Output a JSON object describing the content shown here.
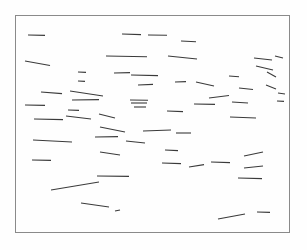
{
  "figure": {
    "name": "line-segment-orientation-field",
    "background_color": "#fefefe",
    "ink_color": "#3a3a3a",
    "frame_color": "#8a8a8a",
    "frame_stroke_width": 1,
    "canvas": {
      "width": 307,
      "height": 250
    }
  },
  "frame": {
    "x": 15.5,
    "y": 15.5,
    "width": 274,
    "height": 217
  },
  "chart_data": {
    "type": "scatter",
    "title": "",
    "subtitle": "",
    "xlabel": "",
    "ylabel": "",
    "grid": false,
    "legend": null,
    "axis_ticks": [],
    "xlim": [
      15,
      290
    ],
    "ylim": [
      15,
      233
    ],
    "series": [
      {
        "name": "segments",
        "element": "line",
        "count": 66,
        "stroke": "#3a3a3a",
        "stroke_width": 1.1,
        "values": [
          {
            "x1": 28,
            "y1": 35,
            "x2": 45,
            "y2": 35.4
          },
          {
            "x1": 122,
            "y1": 34,
            "x2": 141,
            "y2": 34.6
          },
          {
            "x1": 148,
            "y1": 35,
            "x2": 167,
            "y2": 35.2
          },
          {
            "x1": 181,
            "y1": 41,
            "x2": 196,
            "y2": 41.8
          },
          {
            "x1": 106,
            "y1": 56,
            "x2": 147,
            "y2": 56.8
          },
          {
            "x1": 168,
            "y1": 56,
            "x2": 197,
            "y2": 59
          },
          {
            "x1": 25,
            "y1": 61,
            "x2": 50,
            "y2": 65.5
          },
          {
            "x1": 254,
            "y1": 58,
            "x2": 272,
            "y2": 60
          },
          {
            "x1": 275,
            "y1": 56,
            "x2": 283,
            "y2": 58
          },
          {
            "x1": 78,
            "y1": 72,
            "x2": 86,
            "y2": 72.4
          },
          {
            "x1": 114,
            "y1": 73,
            "x2": 130,
            "y2": 72.6
          },
          {
            "x1": 131,
            "y1": 75,
            "x2": 158,
            "y2": 75.6
          },
          {
            "x1": 256,
            "y1": 66,
            "x2": 273,
            "y2": 70
          },
          {
            "x1": 78,
            "y1": 81,
            "x2": 85,
            "y2": 81.4
          },
          {
            "x1": 138,
            "y1": 85,
            "x2": 153,
            "y2": 84.4
          },
          {
            "x1": 175,
            "y1": 82,
            "x2": 186,
            "y2": 81.6
          },
          {
            "x1": 196,
            "y1": 82,
            "x2": 214,
            "y2": 86
          },
          {
            "x1": 267,
            "y1": 72,
            "x2": 276,
            "y2": 77
          },
          {
            "x1": 229,
            "y1": 76,
            "x2": 239,
            "y2": 76.8
          },
          {
            "x1": 41,
            "y1": 92,
            "x2": 62,
            "y2": 93.6
          },
          {
            "x1": 70,
            "y1": 91,
            "x2": 103,
            "y2": 96
          },
          {
            "x1": 239,
            "y1": 88,
            "x2": 253,
            "y2": 89.5
          },
          {
            "x1": 266,
            "y1": 85,
            "x2": 276,
            "y2": 89
          },
          {
            "x1": 278,
            "y1": 93,
            "x2": 285,
            "y2": 94
          },
          {
            "x1": 72,
            "y1": 100,
            "x2": 99,
            "y2": 99.6
          },
          {
            "x1": 209,
            "y1": 98,
            "x2": 229,
            "y2": 95.5
          },
          {
            "x1": 25,
            "y1": 105,
            "x2": 45,
            "y2": 105.4
          },
          {
            "x1": 130,
            "y1": 100,
            "x2": 148,
            "y2": 100.2
          },
          {
            "x1": 131,
            "y1": 103,
            "x2": 147,
            "y2": 103
          },
          {
            "x1": 134,
            "y1": 107,
            "x2": 146,
            "y2": 107
          },
          {
            "x1": 68,
            "y1": 110,
            "x2": 79,
            "y2": 110.4
          },
          {
            "x1": 194,
            "y1": 104,
            "x2": 215,
            "y2": 104.4
          },
          {
            "x1": 232,
            "y1": 102,
            "x2": 248,
            "y2": 103
          },
          {
            "x1": 277,
            "y1": 101,
            "x2": 284,
            "y2": 101.4
          },
          {
            "x1": 34,
            "y1": 119,
            "x2": 63,
            "y2": 119.6
          },
          {
            "x1": 66,
            "y1": 116,
            "x2": 91,
            "y2": 119
          },
          {
            "x1": 99,
            "y1": 114,
            "x2": 115,
            "y2": 118
          },
          {
            "x1": 167,
            "y1": 111,
            "x2": 183,
            "y2": 111.6
          },
          {
            "x1": 230,
            "y1": 117,
            "x2": 256,
            "y2": 118
          },
          {
            "x1": 100,
            "y1": 127,
            "x2": 125,
            "y2": 132
          },
          {
            "x1": 143,
            "y1": 131,
            "x2": 171,
            "y2": 130
          },
          {
            "x1": 176,
            "y1": 133,
            "x2": 191,
            "y2": 133
          },
          {
            "x1": 33,
            "y1": 140,
            "x2": 72,
            "y2": 142
          },
          {
            "x1": 95,
            "y1": 137,
            "x2": 118,
            "y2": 136.6
          },
          {
            "x1": 126,
            "y1": 141,
            "x2": 145,
            "y2": 143
          },
          {
            "x1": 100,
            "y1": 152,
            "x2": 120,
            "y2": 155
          },
          {
            "x1": 165,
            "y1": 150,
            "x2": 178,
            "y2": 150.6
          },
          {
            "x1": 244,
            "y1": 156,
            "x2": 263,
            "y2": 152
          },
          {
            "x1": 32,
            "y1": 160,
            "x2": 51,
            "y2": 160.4
          },
          {
            "x1": 162,
            "y1": 163,
            "x2": 181,
            "y2": 163.6
          },
          {
            "x1": 189,
            "y1": 167,
            "x2": 204,
            "y2": 164.6
          },
          {
            "x1": 211,
            "y1": 162,
            "x2": 230,
            "y2": 162.6
          },
          {
            "x1": 244,
            "y1": 168,
            "x2": 263,
            "y2": 166
          },
          {
            "x1": 97,
            "y1": 176,
            "x2": 129,
            "y2": 176.4
          },
          {
            "x1": 238,
            "y1": 178,
            "x2": 262,
            "y2": 178.6
          },
          {
            "x1": 51,
            "y1": 190,
            "x2": 99,
            "y2": 182
          },
          {
            "x1": 81,
            "y1": 203,
            "x2": 109,
            "y2": 207
          },
          {
            "x1": 115,
            "y1": 211,
            "x2": 120,
            "y2": 210
          },
          {
            "x1": 218,
            "y1": 219,
            "x2": 245,
            "y2": 214
          },
          {
            "x1": 257,
            "y1": 212,
            "x2": 270,
            "y2": 212.4
          }
        ]
      }
    ]
  }
}
